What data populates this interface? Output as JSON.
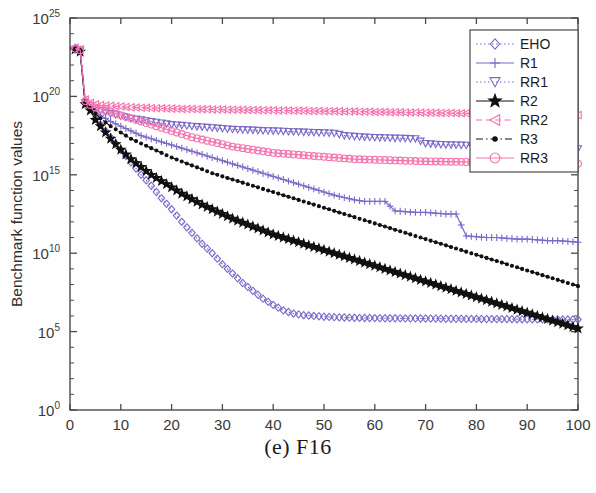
{
  "figure": {
    "caption": "(e) F16"
  },
  "axes": {
    "xlabel": "Number of generations",
    "ylabel": "Benchmark function values",
    "xticks": [
      "0",
      "10",
      "20",
      "30",
      "40",
      "50",
      "60",
      "70",
      "80",
      "90",
      "100"
    ],
    "yticks": [
      "10^0",
      "10^5",
      "10^10",
      "10^15",
      "10^20",
      "10^25"
    ],
    "ytick_bases": [
      "10",
      "10",
      "10",
      "10",
      "10",
      "10"
    ],
    "ytick_exponents": [
      "0",
      "5",
      "10",
      "15",
      "20",
      "25"
    ]
  },
  "legend": {
    "entries": [
      {
        "label": "EHO",
        "color": "#7B68C8",
        "marker": "diamond",
        "line": "dotted"
      },
      {
        "label": "R1",
        "color": "#7B68C8",
        "marker": "plus",
        "line": "solid"
      },
      {
        "label": "RR1",
        "color": "#7B68C8",
        "marker": "triangle-down",
        "line": "dotted"
      },
      {
        "label": "R2",
        "color": "#101010",
        "marker": "star",
        "line": "solid"
      },
      {
        "label": "RR2",
        "color": "#F571AE",
        "marker": "triangle-left",
        "line": "dashed"
      },
      {
        "label": "R3",
        "color": "#101010",
        "marker": "dot",
        "line": "dashdot"
      },
      {
        "label": "RR3",
        "color": "#F571AE",
        "marker": "circle",
        "line": "solid"
      }
    ]
  },
  "chart_data": {
    "type": "line",
    "title": "(e) F16",
    "xlabel": "Number of generations",
    "ylabel": "Benchmark function values",
    "yscale": "log",
    "xlim": [
      0,
      100
    ],
    "ylim": [
      1,
      1e+25
    ],
    "grid": false,
    "legend_position": "top-right",
    "x": [
      1,
      2,
      3,
      4,
      5,
      6,
      8,
      10,
      12,
      14,
      16,
      18,
      20,
      22,
      24,
      26,
      28,
      30,
      32,
      34,
      36,
      38,
      40,
      42,
      44,
      46,
      48,
      50,
      52,
      54,
      56,
      58,
      60,
      62,
      64,
      66,
      68,
      70,
      72,
      74,
      76,
      78,
      80,
      82,
      84,
      86,
      88,
      90,
      92,
      94,
      96,
      98,
      100
    ],
    "series": [
      {
        "name": "EHO",
        "color": "#7B68C8",
        "log10_values": [
          23.0,
          22.9,
          19.6,
          19.2,
          18.6,
          18.2,
          17.4,
          16.6,
          15.8,
          15.0,
          14.3,
          13.5,
          12.8,
          12.0,
          11.3,
          10.6,
          10.0,
          9.3,
          8.7,
          8.1,
          7.6,
          7.1,
          6.7,
          6.35,
          6.15,
          6.05,
          6.0,
          5.95,
          5.92,
          5.9,
          5.88,
          5.87,
          5.86,
          5.85,
          5.85,
          5.84,
          5.84,
          5.83,
          5.83,
          5.82,
          5.82,
          5.81,
          5.81,
          5.8,
          5.8,
          5.8,
          5.79,
          5.79,
          5.78,
          5.78,
          5.78,
          5.77,
          5.77
        ]
      },
      {
        "name": "R1",
        "color": "#7B68C8",
        "log10_values": [
          23.0,
          22.9,
          19.5,
          19.3,
          19.0,
          18.8,
          18.4,
          18.1,
          17.8,
          17.5,
          17.3,
          17.1,
          16.9,
          16.7,
          16.5,
          16.3,
          16.1,
          15.9,
          15.7,
          15.5,
          15.3,
          15.1,
          14.9,
          14.7,
          14.5,
          14.3,
          14.1,
          13.9,
          13.7,
          13.55,
          13.4,
          13.3,
          13.3,
          13.3,
          12.7,
          12.65,
          12.6,
          12.6,
          12.55,
          12.5,
          12.5,
          11.1,
          11.05,
          11.0,
          11.0,
          10.95,
          10.9,
          10.9,
          10.85,
          10.8,
          10.8,
          10.75,
          10.7
        ]
      },
      {
        "name": "RR1",
        "color": "#7B68C8",
        "log10_values": [
          23.0,
          22.9,
          19.6,
          19.4,
          19.2,
          19.1,
          18.9,
          18.75,
          18.6,
          18.5,
          18.4,
          18.3,
          18.2,
          18.15,
          18.1,
          18.05,
          18.0,
          17.95,
          17.9,
          17.88,
          17.85,
          17.82,
          17.8,
          17.78,
          17.75,
          17.72,
          17.7,
          17.68,
          17.65,
          17.5,
          17.45,
          17.4,
          17.38,
          17.36,
          17.34,
          17.32,
          17.3,
          17.0,
          16.95,
          16.92,
          16.9,
          16.88,
          16.86,
          16.84,
          16.82,
          16.8,
          16.78,
          16.76,
          16.74,
          16.72,
          16.7,
          16.68,
          16.66
        ]
      },
      {
        "name": "R2",
        "color": "#101010",
        "log10_values": [
          23.0,
          22.85,
          19.5,
          19.1,
          18.5,
          18.1,
          17.3,
          16.6,
          16.0,
          15.5,
          15.0,
          14.6,
          14.2,
          13.8,
          13.45,
          13.1,
          12.8,
          12.5,
          12.2,
          11.95,
          11.7,
          11.45,
          11.2,
          11.0,
          10.8,
          10.6,
          10.4,
          10.2,
          10.0,
          9.8,
          9.6,
          9.4,
          9.2,
          9.0,
          8.8,
          8.6,
          8.4,
          8.2,
          8.0,
          7.8,
          7.6,
          7.4,
          7.2,
          7.0,
          6.8,
          6.6,
          6.4,
          6.2,
          6.0,
          5.8,
          5.6,
          5.4,
          5.2
        ]
      },
      {
        "name": "RR2",
        "color": "#F571AE",
        "log10_values": [
          23.1,
          23.0,
          19.8,
          19.6,
          19.5,
          19.45,
          19.4,
          19.35,
          19.3,
          19.28,
          19.26,
          19.24,
          19.22,
          19.2,
          19.19,
          19.18,
          19.17,
          19.16,
          19.15,
          19.14,
          19.13,
          19.12,
          19.11,
          19.1,
          19.09,
          19.08,
          19.07,
          19.06,
          19.05,
          19.04,
          19.03,
          19.02,
          19.01,
          19.0,
          18.99,
          18.98,
          18.97,
          18.96,
          18.95,
          18.94,
          18.93,
          18.92,
          18.91,
          18.9,
          18.89,
          18.88,
          18.87,
          18.86,
          18.85,
          18.84,
          18.83,
          18.82,
          18.81
        ]
      },
      {
        "name": "R3",
        "color": "#101010",
        "log10_values": [
          23.0,
          22.88,
          19.55,
          19.25,
          18.9,
          18.6,
          18.1,
          17.7,
          17.3,
          17.0,
          16.7,
          16.4,
          16.1,
          15.85,
          15.6,
          15.35,
          15.1,
          14.9,
          14.7,
          14.5,
          14.3,
          14.1,
          13.9,
          13.7,
          13.5,
          13.3,
          13.1,
          12.9,
          12.7,
          12.5,
          12.3,
          12.1,
          11.9,
          11.7,
          11.5,
          11.3,
          11.1,
          10.9,
          10.7,
          10.5,
          10.3,
          10.1,
          9.9,
          9.7,
          9.5,
          9.3,
          9.1,
          8.9,
          8.7,
          8.5,
          8.3,
          8.1,
          7.9
        ]
      },
      {
        "name": "RR3",
        "color": "#F571AE",
        "log10_values": [
          23.05,
          22.95,
          19.7,
          19.45,
          19.3,
          19.2,
          19.0,
          18.8,
          18.6,
          18.4,
          18.2,
          18.0,
          17.8,
          17.6,
          17.4,
          17.25,
          17.1,
          16.95,
          16.8,
          16.7,
          16.6,
          16.5,
          16.4,
          16.35,
          16.3,
          16.25,
          16.2,
          16.15,
          16.1,
          16.05,
          16.0,
          15.98,
          15.96,
          15.94,
          15.92,
          15.9,
          15.88,
          15.86,
          15.85,
          15.84,
          15.83,
          15.82,
          15.81,
          15.8,
          15.79,
          15.78,
          15.77,
          15.76,
          15.75,
          15.74,
          15.73,
          15.72,
          15.71
        ]
      }
    ]
  }
}
